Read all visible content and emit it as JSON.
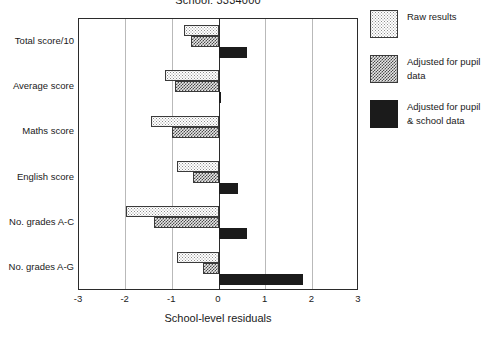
{
  "chart_data": {
    "type": "bar",
    "orientation": "horizontal",
    "title": "School: 3334000",
    "xlabel": "School-level residuals",
    "ylabel": "",
    "xlim": [
      -3,
      3
    ],
    "xticks": [
      -3,
      -2,
      -1,
      0,
      1,
      2,
      3
    ],
    "xtick_labels": [
      "-3",
      "-2",
      "-1",
      "0",
      "1",
      "2",
      "3"
    ],
    "grid": true,
    "grid_axis": "x",
    "legend_position": "right",
    "categories": [
      "Total score/10",
      "Average score",
      "Maths score",
      "English score",
      "No. grades A-C",
      "No. grades A-G"
    ],
    "series": [
      {
        "name": "Raw results",
        "fill": "light-dotted",
        "values": [
          -0.75,
          -1.15,
          -1.45,
          -0.9,
          -2.0,
          -0.9
        ]
      },
      {
        "name": "Adjusted for pupil data",
        "fill": "dark-checkered",
        "values": [
          -0.6,
          -0.95,
          -1.0,
          -0.55,
          -1.4,
          -0.35
        ]
      },
      {
        "name": "Adjusted for pupil & school data",
        "fill": "solid-black",
        "values": [
          0.6,
          0.05,
          0.0,
          0.4,
          0.6,
          1.8
        ]
      }
    ]
  },
  "legend": {
    "entries": [
      "Raw results",
      "Adjusted for pupil data",
      "Adjusted for pupil & school data"
    ]
  },
  "colors": {
    "axis": "#2b2b2b",
    "gridline": "#b9b9b9",
    "series_raw": "#ffffff",
    "series_pupil": "#4a4a4a",
    "series_pupil_school": "#1b1b1b",
    "background": "#ffffff",
    "text": "#1a1a1a"
  }
}
